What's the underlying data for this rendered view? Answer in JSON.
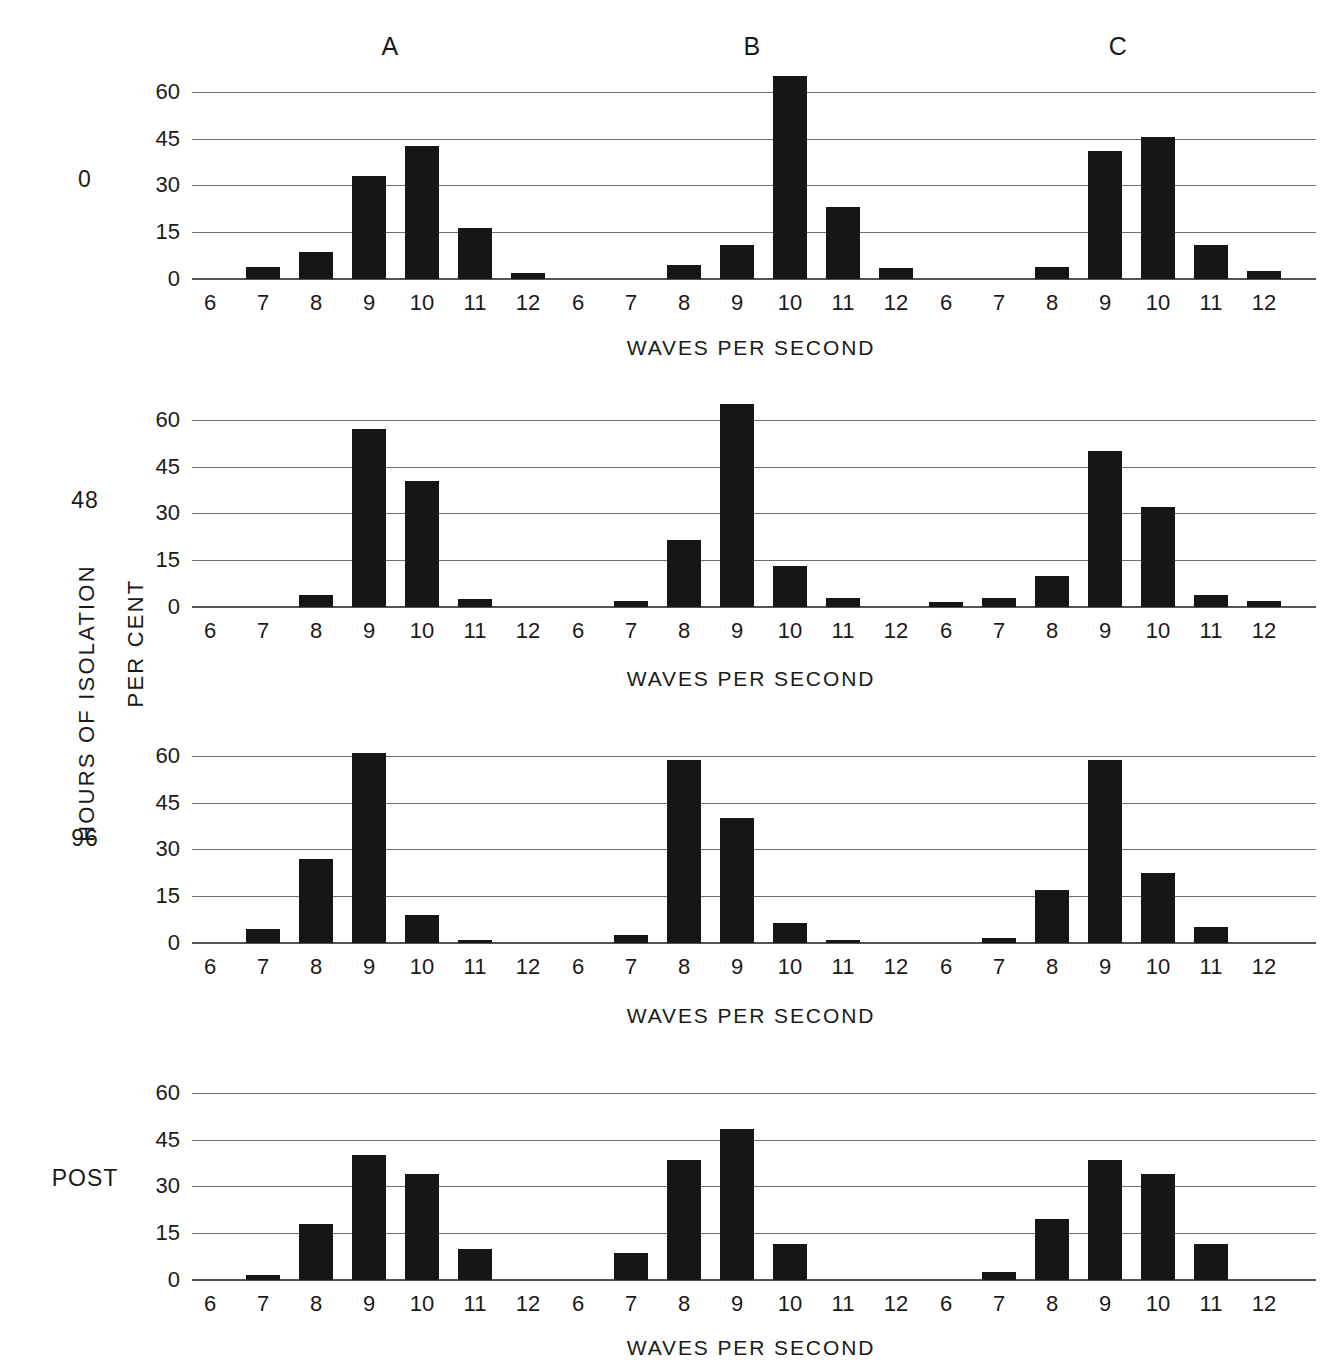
{
  "figure": {
    "y_outer_title": "HOURS OF ISOLATION",
    "y_inner_title": "PER CENT",
    "x_axis_title": "WAVES PER SECOND",
    "column_headers": [
      "A",
      "B",
      "C"
    ],
    "row_labels": [
      "0",
      "48",
      "96",
      "POST"
    ],
    "bar_color": "#161616",
    "grid_color": "#6e6e6e"
  },
  "chart_data": {
    "type": "bar",
    "title": "",
    "xlabel": "WAVES PER SECOND",
    "ylabel": "PER CENT",
    "row_variable": "HOURS OF ISOLATION",
    "column_variable": "subject",
    "categories": [
      6,
      7,
      8,
      9,
      10,
      11,
      12
    ],
    "xlim": [
      5.5,
      12.5
    ],
    "ylim": [
      0,
      68
    ],
    "yticks": [
      0,
      15,
      30,
      45,
      60
    ],
    "ytick_labels": [
      "0",
      "15",
      "30",
      "45",
      "60"
    ],
    "grid": true,
    "legend": "none",
    "panels": [
      {
        "row_label": "0",
        "column_label": "A",
        "values": [
          0,
          4,
          8.5,
          33,
          42.5,
          16.5,
          2
        ]
      },
      {
        "row_label": "0",
        "column_label": "B",
        "values": [
          0,
          0,
          4.5,
          11,
          65,
          23,
          3.5
        ]
      },
      {
        "row_label": "0",
        "column_label": "C",
        "values": [
          0,
          0,
          4,
          41,
          45.5,
          11,
          2.5
        ]
      },
      {
        "row_label": "48",
        "column_label": "A",
        "values": [
          0,
          0,
          4,
          57,
          40.5,
          2.5,
          0
        ]
      },
      {
        "row_label": "48",
        "column_label": "B",
        "values": [
          0,
          2,
          21.5,
          65,
          13,
          3,
          0
        ]
      },
      {
        "row_label": "48",
        "column_label": "C",
        "values": [
          1.5,
          3,
          10,
          50,
          32,
          4,
          2
        ]
      },
      {
        "row_label": "96",
        "column_label": "A",
        "values": [
          0,
          4.5,
          27,
          61,
          9,
          1,
          0
        ]
      },
      {
        "row_label": "96",
        "column_label": "B",
        "values": [
          0,
          2.5,
          58.5,
          40,
          6.5,
          1,
          0
        ]
      },
      {
        "row_label": "96",
        "column_label": "C",
        "values": [
          0,
          1.5,
          17,
          58.5,
          22.5,
          5,
          0
        ]
      },
      {
        "row_label": "POST",
        "column_label": "A",
        "values": [
          0,
          1.5,
          18,
          40,
          34,
          10,
          0
        ]
      },
      {
        "row_label": "POST",
        "column_label": "B",
        "values": [
          0,
          8.5,
          38.5,
          48.5,
          11.5,
          0,
          0
        ]
      },
      {
        "row_label": "POST",
        "column_label": "C",
        "values": [
          0,
          2.5,
          19.5,
          38.5,
          34,
          11.5,
          0
        ]
      }
    ]
  }
}
